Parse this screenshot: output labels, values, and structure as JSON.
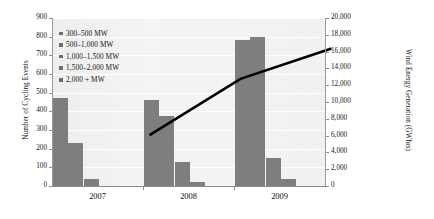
{
  "chart_data": {
    "type": "bar",
    "title": "",
    "categories": [
      "2007",
      "2008",
      "2009"
    ],
    "series": [
      {
        "name": "300–500 MW",
        "values": [
          470,
          460,
          780
        ]
      },
      {
        "name": "500–1,000 MW",
        "values": [
          228,
          375,
          800
        ]
      },
      {
        "name": "1,000–1,500 MW",
        "values": [
          40,
          130,
          150
        ]
      },
      {
        "name": "1,500–2,000 MW",
        "values": [
          0,
          20,
          40
        ]
      },
      {
        "name": "2,000 + MW",
        "values": [
          0,
          0,
          0
        ]
      }
    ],
    "overlay": {
      "type": "line",
      "name": "Wind Energy Generation",
      "axis": "right",
      "values": [
        8200,
        14900,
        18500
      ],
      "color": "#000000"
    },
    "xlabel": "",
    "ylabel": "Number of Cycling Events",
    "y2label": "Wind Energy Generation (GWhrs)",
    "ylim": [
      0,
      900
    ],
    "y2lim": [
      0,
      20000
    ],
    "yticks": [
      "0",
      "100",
      "200",
      "300",
      "400",
      "500",
      "600",
      "700",
      "800",
      "900"
    ],
    "y2ticks": [
      "0",
      "2,000",
      "4,000",
      "6,000",
      "8,000",
      "10,000",
      "12,000",
      "14,000",
      "16,000",
      "18,000",
      "20,000"
    ],
    "grid": true,
    "legend_position": "upper-left",
    "bar_color": "#7e7e7e",
    "plot_background": "#f2f2f2"
  }
}
